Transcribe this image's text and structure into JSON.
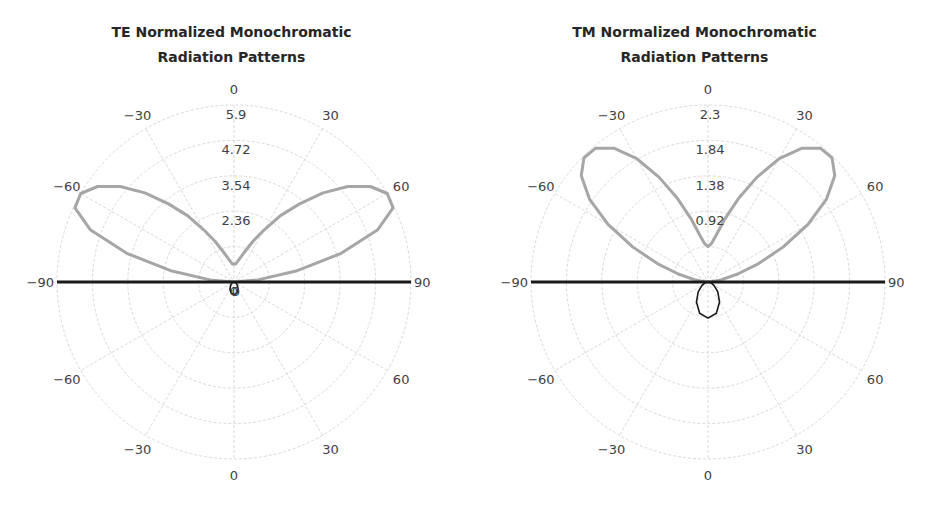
{
  "colors": {
    "grid": "#d9d9d9",
    "main_lobe": "#a6a6a6",
    "back_lobe": "#1a1a1a",
    "text": "#404040",
    "title": "#262626"
  },
  "chart_data": [
    {
      "type": "polar",
      "title": "TE Normalized Monochromatic Radiation Patterns",
      "title_lines": [
        "TE Normalized Monochromatic",
        "Radiation Patterns"
      ],
      "angle_unit": "degrees",
      "angular_ticks": [
        {
          "angle": 0,
          "label": "0",
          "side": "top"
        },
        {
          "angle": -30,
          "label": "−30",
          "side": "top"
        },
        {
          "angle": 30,
          "label": "30",
          "side": "top"
        },
        {
          "angle": -60,
          "label": "−60",
          "side": "top"
        },
        {
          "angle": 60,
          "label": "60",
          "side": "top"
        },
        {
          "angle": -90,
          "label": "−90",
          "side": "mid"
        },
        {
          "angle": 90,
          "label": "90",
          "side": "mid"
        },
        {
          "angle": -60,
          "label": "−60",
          "side": "bottom"
        },
        {
          "angle": 60,
          "label": "60",
          "side": "bottom"
        },
        {
          "angle": -30,
          "label": "−30",
          "side": "bottom"
        },
        {
          "angle": 30,
          "label": "30",
          "side": "bottom"
        },
        {
          "angle": 0,
          "label": "0",
          "side": "bottom"
        }
      ],
      "radial_ticks": [
        0,
        1.18,
        2.36,
        3.54,
        4.72,
        5.9
      ],
      "radial_tick_labels": [
        "0",
        "",
        "2.36",
        "3.54",
        "4.72",
        "5.9"
      ],
      "rlim": [
        0,
        5.9
      ],
      "grid": true,
      "series": [
        {
          "name": "forward (upper half-space)",
          "color": "#a6a6a6",
          "theta": [
            -90,
            -85,
            -80,
            -75,
            -70,
            -65,
            -60,
            -55,
            -50,
            -45,
            -40,
            -35,
            -30,
            -25,
            -20,
            -15,
            -10,
            -5,
            0,
            5,
            10,
            15,
            20,
            25,
            30,
            35,
            40,
            45,
            50,
            55,
            60,
            65,
            70,
            75,
            80,
            85,
            90
          ],
          "r": [
            0,
            0.8,
            2.1,
            3.7,
            5.1,
            5.85,
            5.9,
            5.55,
            4.95,
            4.2,
            3.4,
            2.7,
            2.0,
            1.5,
            1.1,
            0.85,
            0.7,
            0.6,
            0.6,
            0.6,
            0.7,
            0.85,
            1.1,
            1.5,
            2.0,
            2.7,
            3.4,
            4.2,
            4.95,
            5.55,
            5.9,
            5.85,
            5.1,
            3.7,
            2.1,
            0.8,
            0
          ]
        },
        {
          "name": "backward (lower half-space)",
          "color": "#1a1a1a",
          "theta": [
            90,
            95,
            100,
            105,
            110,
            120,
            135,
            150,
            165,
            180,
            195,
            210,
            225,
            240,
            250,
            255,
            260,
            265,
            270
          ],
          "r": [
            5.9,
            0.02,
            0.02,
            0.03,
            0.04,
            0.08,
            0.16,
            0.27,
            0.38,
            0.42,
            0.38,
            0.27,
            0.16,
            0.08,
            0.04,
            0.03,
            0.02,
            0.02,
            5.9
          ]
        }
      ]
    },
    {
      "type": "polar",
      "title": "TM Normalized Monochromatic Radiation Patterns",
      "title_lines": [
        "TM Normalized Monochromatic",
        "Radiation Patterns"
      ],
      "angle_unit": "degrees",
      "angular_ticks": [
        {
          "angle": 0,
          "label": "0",
          "side": "top"
        },
        {
          "angle": -30,
          "label": "−30",
          "side": "top"
        },
        {
          "angle": 30,
          "label": "30",
          "side": "top"
        },
        {
          "angle": -60,
          "label": "−60",
          "side": "top"
        },
        {
          "angle": 60,
          "label": "60",
          "side": "top"
        },
        {
          "angle": -90,
          "label": "−90",
          "side": "mid"
        },
        {
          "angle": 90,
          "label": "90",
          "side": "mid"
        },
        {
          "angle": -60,
          "label": "−60",
          "side": "bottom"
        },
        {
          "angle": 60,
          "label": "60",
          "side": "bottom"
        },
        {
          "angle": -30,
          "label": "−30",
          "side": "bottom"
        },
        {
          "angle": 30,
          "label": "30",
          "side": "bottom"
        },
        {
          "angle": 0,
          "label": "0",
          "side": "bottom"
        }
      ],
      "radial_ticks": [
        0,
        0.46,
        0.92,
        1.38,
        1.84,
        2.3
      ],
      "radial_tick_labels": [
        "",
        "",
        "0.92",
        "1.38",
        "1.84",
        "2.3"
      ],
      "rlim": [
        0,
        2.3
      ],
      "grid": true,
      "series": [
        {
          "name": "forward (upper half-space)",
          "color": "#a6a6a6",
          "theta": [
            -90,
            -85,
            -80,
            -75,
            -70,
            -65,
            -60,
            -55,
            -50,
            -45,
            -40,
            -35,
            -30,
            -25,
            -20,
            -15,
            -10,
            -5,
            0,
            5,
            10,
            15,
            20,
            25,
            30,
            35,
            40,
            45,
            50,
            55,
            60,
            65,
            70,
            75,
            80,
            85,
            90
          ],
          "r": [
            0,
            0.05,
            0.18,
            0.4,
            0.7,
            1.08,
            1.5,
            1.88,
            2.15,
            2.28,
            2.27,
            2.12,
            1.85,
            1.5,
            1.15,
            0.85,
            0.62,
            0.5,
            0.46,
            0.5,
            0.62,
            0.85,
            1.15,
            1.5,
            1.85,
            2.12,
            2.27,
            2.28,
            2.15,
            1.88,
            1.5,
            1.08,
            0.7,
            0.4,
            0.18,
            0.05,
            0
          ]
        },
        {
          "name": "backward (lower half-space)",
          "color": "#1a1a1a",
          "theta": [
            90,
            95,
            100,
            105,
            110,
            120,
            135,
            150,
            165,
            180,
            195,
            210,
            225,
            240,
            250,
            255,
            260,
            265,
            270
          ],
          "r": [
            2.3,
            0.01,
            0.02,
            0.03,
            0.05,
            0.09,
            0.18,
            0.3,
            0.42,
            0.47,
            0.42,
            0.3,
            0.18,
            0.09,
            0.05,
            0.03,
            0.02,
            0.01,
            2.3
          ]
        }
      ]
    }
  ]
}
